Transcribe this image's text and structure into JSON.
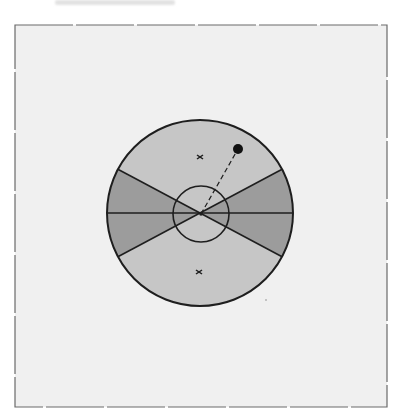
{
  "figure": {
    "header_text": "",
    "frame": {
      "x": 15,
      "y": 25,
      "width": 372,
      "height": 382,
      "stroke": "#6a6a6a",
      "fill": "#f0f0f0"
    },
    "outer_circle": {
      "cx": 200,
      "cy": 213,
      "r": 93,
      "fill": "#c6c6c6",
      "stroke": "#1e1e1e"
    },
    "dark_wedges": {
      "half_angle_deg": 28,
      "fill": "#9c9c9c"
    },
    "inner_circle": {
      "cx": 201,
      "cy": 214,
      "r": 28
    },
    "markers": [
      {
        "type": "x",
        "x": 200,
        "y": 157
      },
      {
        "type": "x",
        "x": 199,
        "y": 272
      }
    ],
    "dot": {
      "x": 238,
      "y": 149,
      "r": 5,
      "color": "#111111"
    },
    "dashed_line": {
      "from": [
        201,
        214
      ],
      "to": [
        238,
        149
      ]
    },
    "colors": {
      "background": "#f0f0f0",
      "light_sector": "#c6c6c6",
      "dark_sector": "#9c9c9c",
      "lines": "#1e1e1e"
    }
  }
}
